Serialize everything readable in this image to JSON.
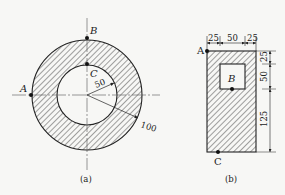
{
  "figure_a": {
    "caption": "(a)",
    "points": {
      "A": "A",
      "B": "B",
      "C": "C"
    },
    "inner_radius_label": "50",
    "outer_radius_label": "100"
  },
  "figure_b": {
    "caption": "(b)",
    "points": {
      "A": "A",
      "B": "B",
      "C": "C"
    },
    "top_dims": [
      "25",
      "50",
      "25"
    ],
    "side_dims": [
      "25",
      "50",
      "125"
    ]
  },
  "colors": {
    "ink": "#222222",
    "background": "#f7f7f5"
  }
}
